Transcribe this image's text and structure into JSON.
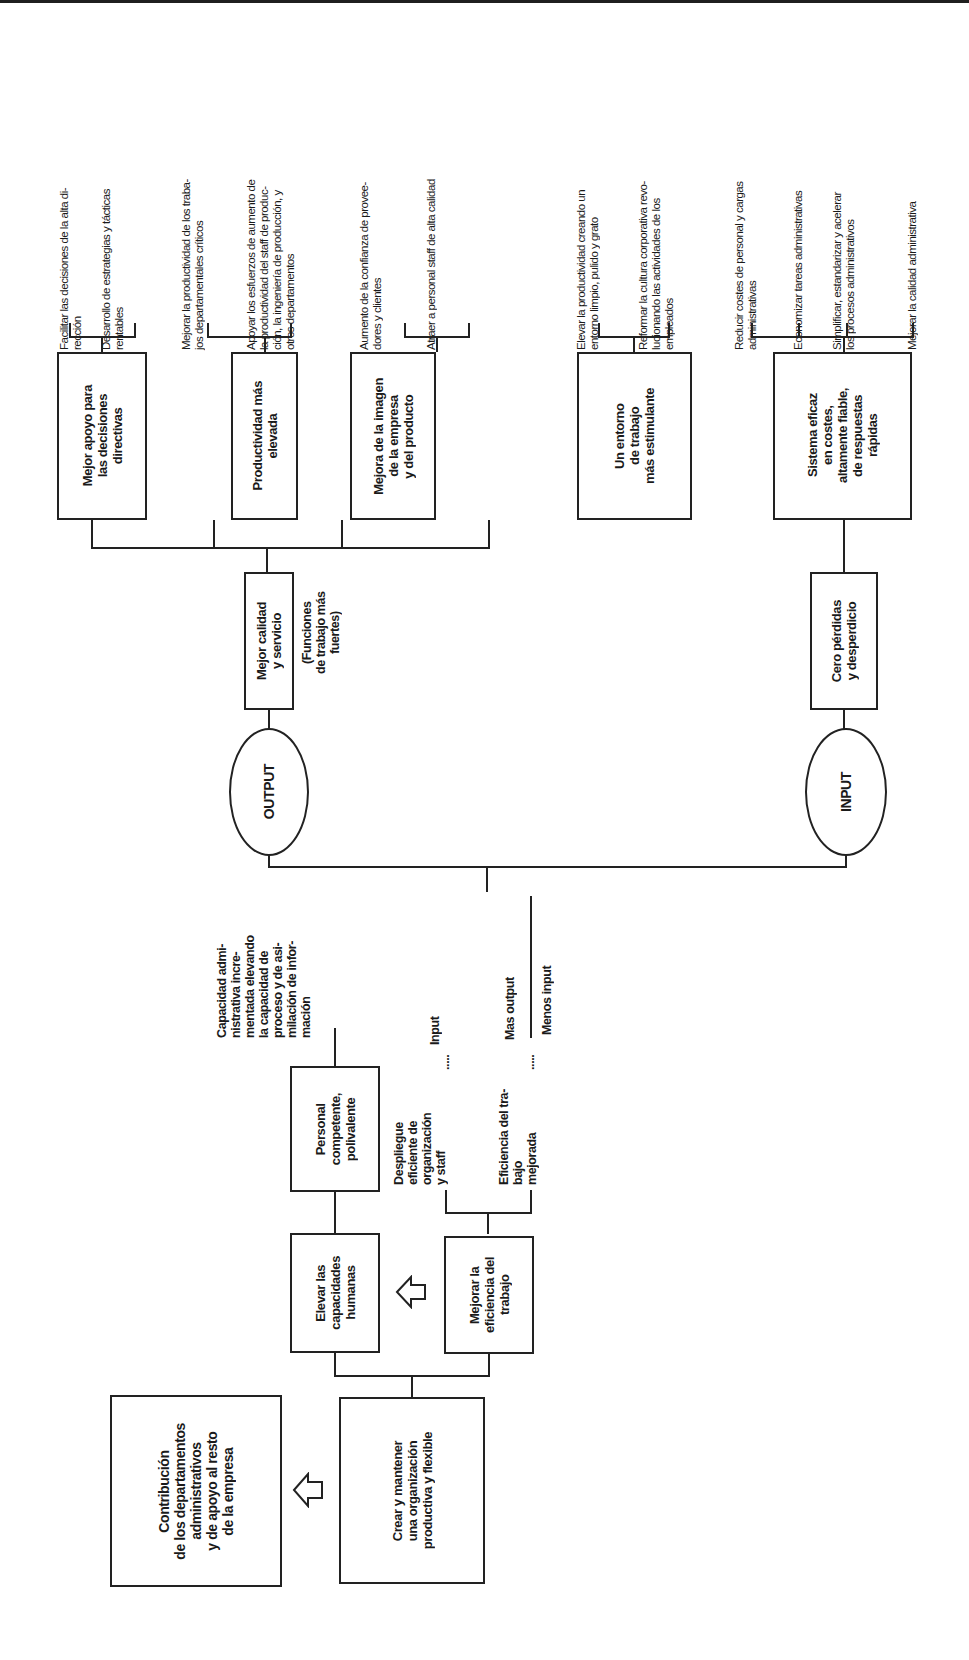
{
  "diagram": {
    "goal": "Contribución\nde los departamentos\nadministrativos\ny de apoyo al resto\nde la empresa",
    "root": "Crear y mantener\nuna organización\nproductiva y flexible",
    "branches": {
      "human": "Elevar las\ncapacidades\nhumanas",
      "efficiency": "Mejorar la\neficiencia del\ntrabajo"
    },
    "staff": "Personal\ncompetente,\npolivalente",
    "capacity": "Capacidad admi-\nnistrativa incre-\nmentada elevando\nla capacidad de\nproceso y de asi-\nmilación de infor-\nmación",
    "efficiency_children": [
      "Despliegue\neficiente de\norganización\ny staff",
      "Eficiencia del tra-\nbajo\nmejorada"
    ],
    "ratio": {
      "input_label": "Input",
      "numerator": "Mas output",
      "denominator": "Menos input",
      "dots": "....."
    },
    "output": {
      "label": "OUTPUT",
      "node": "Mejor calidad\ny servicio",
      "note": "(Funciones\nde trabajo más\nfuertes)",
      "children": [
        {
          "label": "Mejor apoyo para\nlas decisiones\ndirectivas",
          "leaves": [
            "Facilitar las decisiones de la alta di-\nrección",
            "Desarrollo de estrategias y tácticas\nrentables"
          ]
        },
        {
          "label": "Productividad más\nelevada",
          "leaves": [
            "Mejorar la productividad de los traba-\njos departamentales críticos",
            "Apoyar los esfuerzos de aumento de\nla productividad del staff de produc-\nción, la ingeniería de producción, y\notros departamentos"
          ]
        },
        {
          "label": "Mejora de la imagen\nde la empresa\ny del producto",
          "leaves": [
            "Aumento de la confianza de provee-\ndores y clientes",
            "Atraer a personal staff de alta calidad"
          ]
        },
        {
          "label": "Un entorno\nde trabajo\nmás estimulante",
          "leaves": [
            "Elevar la productividad creando un\nentorno limpio, pulido y grato",
            "Reformar la cultura corporativa revo-\nlucionando las actividades de los\nempleados"
          ]
        }
      ]
    },
    "input": {
      "label": "INPUT",
      "node": "Cero pérdidas\ny desperdicio",
      "child": {
        "label": "Sistema eficaz\nen costes,\naltamente fiable,\nde respuestas\nrápidas",
        "leaves": [
          "Reducir costes de personal y cargas\nadministrativas",
          "Economizar tareas administrativas",
          "Simplificar, estandarizar y acelerar\nlos procesos administrativos",
          "Mejorar la calidad administrativa"
        ]
      }
    }
  }
}
